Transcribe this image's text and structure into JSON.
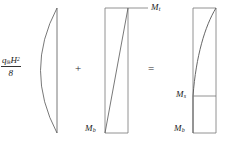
{
  "figure": {
    "ink_color": "#444444",
    "text_color": "#1a1a1a",
    "background": "#ffffff"
  },
  "operators": {
    "plus": "+",
    "equals": "="
  },
  "panels": [
    {
      "id": "panel-load-moment",
      "name": "simply-supported-span-moment-diagram",
      "shape": "parabola-bulging-left",
      "label": {
        "type": "fraction",
        "numerator_base": "q",
        "numerator_subscript": "ik",
        "numerator_variable": "H",
        "numerator_exponent": "2",
        "denominator": "8",
        "plain_text": "q_ik H^2 / 8"
      }
    },
    {
      "id": "panel-end-moment",
      "name": "linear-end-moment-diagram",
      "shape": "linear-diagonal",
      "labels": [
        {
          "name": "moment-top",
          "base": "M",
          "subscript": "t",
          "plain_text": "Mt"
        },
        {
          "name": "moment-bottom",
          "base": "M",
          "subscript": "b",
          "plain_text": "Mb"
        }
      ]
    },
    {
      "id": "panel-resultant-moment",
      "name": "resultant-bending-moment-diagram",
      "shape": "curved-resultant",
      "labels": [
        {
          "name": "moment-span",
          "base": "M",
          "subscript": "s",
          "plain_text": "Ms"
        },
        {
          "name": "moment-bottom",
          "base": "M",
          "subscript": "b",
          "plain_text": "Mb"
        }
      ]
    }
  ]
}
